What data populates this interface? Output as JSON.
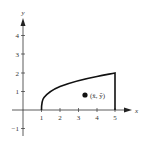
{
  "figure": {
    "x_axis": {
      "label": "x",
      "ticks": [
        {
          "value": 1,
          "label": "1"
        },
        {
          "value": 2,
          "label": "2"
        },
        {
          "value": 3,
          "label": "3"
        },
        {
          "value": 4,
          "label": "4"
        },
        {
          "value": 5,
          "label": "5"
        }
      ]
    },
    "y_axis": {
      "label": "y",
      "ticks": [
        {
          "value": 4,
          "label": "4"
        },
        {
          "value": 3,
          "label": "3"
        },
        {
          "value": 2,
          "label": "2"
        },
        {
          "value": 1,
          "label": "1"
        },
        {
          "value": -1,
          "label": "−1"
        }
      ]
    },
    "region": {
      "curve": "y = sqrt(x - 1)",
      "x_from": 1,
      "x_to": 5,
      "top_right_value": 2
    },
    "centroid": {
      "label": "(x̄, ȳ)",
      "x": 3.4,
      "y": 0.8
    },
    "colors": {
      "stroke": "#111111",
      "axis": "#333333",
      "background": "#ffffff"
    }
  }
}
